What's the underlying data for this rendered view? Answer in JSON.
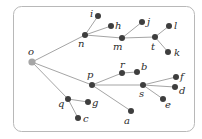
{
  "diagram": {
    "type": "tree",
    "root": "o",
    "colors": {
      "root": "#a6a6a6",
      "node": "#3e3e3e",
      "edge": "#9a9a9a",
      "frame": "#b8b8b8"
    },
    "nodes": [
      {
        "id": "o",
        "x": 32,
        "y": 62,
        "label": "o",
        "lx": 28,
        "ly": 55
      },
      {
        "id": "n",
        "x": 85,
        "y": 35,
        "label": "n",
        "lx": 78,
        "ly": 47
      },
      {
        "id": "i",
        "x": 98,
        "y": 16,
        "label": "i",
        "lx": 90,
        "ly": 17
      },
      {
        "id": "h",
        "x": 111,
        "y": 26,
        "label": "h",
        "lx": 115,
        "ly": 29
      },
      {
        "id": "m",
        "x": 122,
        "y": 38,
        "label": "m",
        "lx": 113,
        "ly": 50
      },
      {
        "id": "j",
        "x": 142,
        "y": 22,
        "label": "j",
        "lx": 147,
        "ly": 25
      },
      {
        "id": "t",
        "x": 155,
        "y": 37,
        "label": "t",
        "lx": 151,
        "ly": 50
      },
      {
        "id": "l",
        "x": 169,
        "y": 26,
        "label": "l",
        "lx": 174,
        "ly": 29
      },
      {
        "id": "k",
        "x": 168,
        "y": 52,
        "label": "k",
        "lx": 174,
        "ly": 56
      },
      {
        "id": "p",
        "x": 92,
        "y": 85,
        "label": "p",
        "lx": 87,
        "ly": 78
      },
      {
        "id": "r",
        "x": 122,
        "y": 73,
        "label": "r",
        "lx": 120,
        "ly": 68
      },
      {
        "id": "b",
        "x": 137,
        "y": 72,
        "label": "b",
        "lx": 141,
        "ly": 70
      },
      {
        "id": "s",
        "x": 143,
        "y": 85,
        "label": "s",
        "lx": 139,
        "ly": 97
      },
      {
        "id": "f",
        "x": 176,
        "y": 77,
        "label": "f",
        "lx": 180,
        "ly": 80
      },
      {
        "id": "d",
        "x": 175,
        "y": 87,
        "label": "d",
        "lx": 179,
        "ly": 94
      },
      {
        "id": "e",
        "x": 163,
        "y": 99,
        "label": "e",
        "lx": 165,
        "ly": 108
      },
      {
        "id": "a",
        "x": 131,
        "y": 111,
        "label": "a",
        "lx": 124,
        "ly": 124
      },
      {
        "id": "q",
        "x": 68,
        "y": 99,
        "label": "q",
        "lx": 58,
        "ly": 107
      },
      {
        "id": "g",
        "x": 88,
        "y": 102,
        "label": "g",
        "lx": 92,
        "ly": 106
      },
      {
        "id": "c",
        "x": 78,
        "y": 118,
        "label": "c",
        "lx": 83,
        "ly": 122
      }
    ],
    "edges": [
      [
        "o",
        "n"
      ],
      [
        "o",
        "p"
      ],
      [
        "o",
        "q"
      ],
      [
        "n",
        "i"
      ],
      [
        "n",
        "h"
      ],
      [
        "n",
        "m"
      ],
      [
        "m",
        "j"
      ],
      [
        "m",
        "t"
      ],
      [
        "t",
        "l"
      ],
      [
        "t",
        "k"
      ],
      [
        "p",
        "r"
      ],
      [
        "p",
        "s"
      ],
      [
        "p",
        "a"
      ],
      [
        "r",
        "b"
      ],
      [
        "s",
        "f"
      ],
      [
        "s",
        "d"
      ],
      [
        "s",
        "e"
      ],
      [
        "q",
        "g"
      ],
      [
        "q",
        "c"
      ]
    ]
  }
}
